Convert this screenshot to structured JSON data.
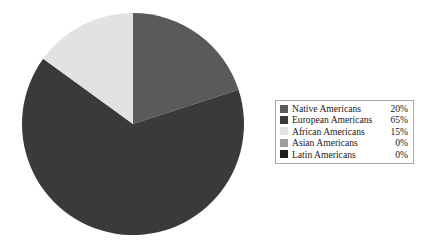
{
  "chart_data": {
    "type": "pie",
    "title": "",
    "labels": [
      "Native Americans",
      "European Americans",
      "African Americans",
      "Asian Americans",
      "Latin Americans"
    ],
    "values": [
      20,
      65,
      15,
      0,
      0
    ],
    "value_labels": [
      "20%",
      "65%",
      "15%",
      "0%",
      "0%"
    ],
    "colors": [
      "#5a5a5a",
      "#3a3a3a",
      "#e2e2e2",
      "#9e9e9e",
      "#1c1c1c"
    ],
    "unit": "%",
    "start_angle_deg": 0,
    "direction": "clockwise",
    "legend_position": "right",
    "grid": false,
    "background": "#ffffff"
  },
  "legend": {
    "border_color": "#a8a8a8",
    "rows": [
      {
        "label": "Native Americans",
        "value": "20%",
        "color": "#5a5a5a"
      },
      {
        "label": "European Americans",
        "value": "65%",
        "color": "#3a3a3a"
      },
      {
        "label": "African Americans",
        "value": "15%",
        "color": "#e2e2e2"
      },
      {
        "label": "Asian Americans",
        "value": "0%",
        "color": "#9e9e9e"
      },
      {
        "label": "Latin Americans",
        "value": "0%",
        "color": "#1c1c1c"
      }
    ]
  },
  "pie": {
    "slices": [
      {
        "name": "Native Americans",
        "percent": 20,
        "color": "#5a5a5a"
      },
      {
        "name": "European Americans",
        "percent": 65,
        "color": "#3a3a3a"
      },
      {
        "name": "African Americans",
        "percent": 15,
        "color": "#e2e2e2"
      }
    ]
  }
}
